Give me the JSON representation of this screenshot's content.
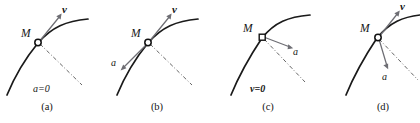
{
  "figure": {
    "type": "physics-vector-diagram",
    "panels": [
      {
        "id": "a",
        "caption": "(a)",
        "point_label": "M",
        "marker_shape": "circle",
        "vectors": [
          {
            "name": "v",
            "label": "v",
            "direction": "tangent-up-right"
          }
        ],
        "condition_label": "a=0",
        "condition_style": "italic"
      },
      {
        "id": "b",
        "caption": "(b)",
        "point_label": "M",
        "marker_shape": "circle",
        "vectors": [
          {
            "name": "v",
            "label": "v",
            "direction": "tangent-up-right"
          },
          {
            "name": "a",
            "label": "a",
            "direction": "tangent-down-left"
          }
        ],
        "condition_label": "",
        "condition_style": "italic"
      },
      {
        "id": "c",
        "caption": "(c)",
        "point_label": "M",
        "marker_shape": "square",
        "vectors": [
          {
            "name": "a",
            "label": "a",
            "direction": "right-down"
          }
        ],
        "condition_label": "v=0",
        "condition_style": "bold-italic"
      },
      {
        "id": "d",
        "caption": "(d)",
        "point_label": "M",
        "marker_shape": "circle",
        "vectors": [
          {
            "name": "v",
            "label": "v",
            "direction": "tangent-up-right"
          },
          {
            "name": "a",
            "label": "a",
            "direction": "down-inward"
          }
        ],
        "condition_label": "",
        "condition_style": "italic"
      }
    ],
    "colors": {
      "curve": "#1a1a1a",
      "vector": "#6e6e74",
      "normal": "#555555",
      "text": "#141414",
      "background": "#ffffff"
    }
  }
}
